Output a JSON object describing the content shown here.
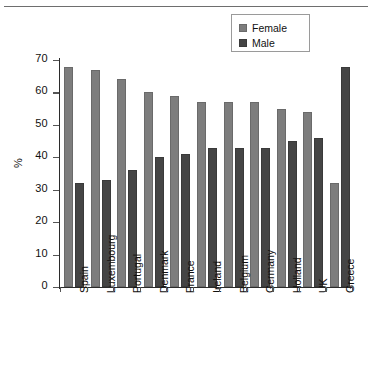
{
  "chart_data": {
    "type": "bar",
    "title": "",
    "xlabel": "",
    "ylabel": "%",
    "ylim": [
      0,
      70
    ],
    "yticks": [
      0,
      10,
      20,
      30,
      40,
      50,
      60,
      70
    ],
    "grid": false,
    "legend_position": "top-right",
    "categories": [
      "Spain",
      "Luxembourg",
      "Portugal",
      "Denmark",
      "France",
      "Ireland",
      "Belgium",
      "Germany",
      "Holland",
      "UK",
      "Greece"
    ],
    "series": [
      {
        "name": "Female",
        "color": "#7d7d7d",
        "values": [
          68,
          67,
          64,
          60,
          59,
          57,
          57,
          57,
          55,
          54,
          32
        ]
      },
      {
        "name": "Male",
        "color": "#454545",
        "values": [
          32,
          33,
          36,
          40,
          41,
          43,
          43,
          43,
          45,
          46,
          68
        ]
      }
    ]
  },
  "legend": {
    "items": [
      {
        "label": "Female",
        "swatch": "female-swatch"
      },
      {
        "label": "Male",
        "swatch": "male-swatch"
      }
    ]
  }
}
